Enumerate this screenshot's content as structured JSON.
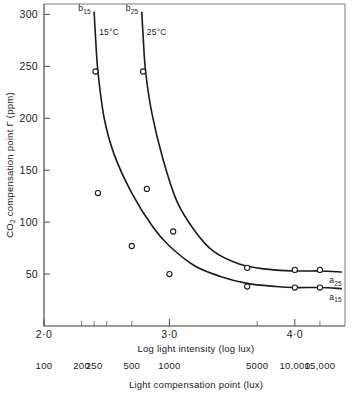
{
  "chart_data": {
    "type": "line",
    "title": "",
    "xlabel": "Log light intensity (log lux)",
    "ylabel": "CO₂ compensation point Γ (ppm)",
    "secondary_xlabel": "Light compensation point (lux)",
    "xlim": [
      2.0,
      4.4
    ],
    "ylim": [
      0,
      310
    ],
    "grid": false,
    "legend": "none",
    "x_ticks": [
      {
        "value": 2.0,
        "label": "2·0",
        "major": true
      },
      {
        "value": 2.3,
        "label": "",
        "major": false
      },
      {
        "value": 2.4,
        "label": "",
        "major": false
      },
      {
        "value": 2.5,
        "label": "",
        "major": false
      },
      {
        "value": 2.7,
        "label": "",
        "major": false
      },
      {
        "value": 3.0,
        "label": "3·0",
        "major": true
      },
      {
        "value": 3.7,
        "label": "",
        "major": false
      },
      {
        "value": 4.0,
        "label": "4·0",
        "major": true
      },
      {
        "value": 4.2,
        "label": "",
        "major": false
      }
    ],
    "y_ticks": [
      {
        "value": 50,
        "label": "50"
      },
      {
        "value": 100,
        "label": "100"
      },
      {
        "value": 150,
        "label": "150"
      },
      {
        "value": 200,
        "label": "200"
      },
      {
        "value": 250,
        "label": "250"
      },
      {
        "value": 300,
        "label": "300"
      }
    ],
    "secondary_x_ticks": [
      {
        "value": 2.0,
        "label": "100"
      },
      {
        "value": 2.3,
        "label": "200"
      },
      {
        "value": 2.4,
        "label": "250"
      },
      {
        "value": 2.7,
        "label": "500"
      },
      {
        "value": 3.0,
        "label": "1000"
      },
      {
        "value": 3.7,
        "label": "5000"
      },
      {
        "value": 4.0,
        "label": "10,000"
      },
      {
        "value": 4.2,
        "label": "15,000"
      }
    ],
    "series": [
      {
        "name": "15°C",
        "label": "15°C",
        "start_label": "b",
        "start_label_sub": "15",
        "end_label": "a",
        "end_label_sub": "15",
        "color": "#1a1a1a",
        "x": [
          2.4,
          2.41,
          2.43,
          2.48,
          2.56,
          2.7,
          2.87,
          3.0,
          3.2,
          3.4,
          3.62,
          3.85,
          4.0,
          4.2,
          4.37
        ],
        "y": [
          302,
          280,
          245,
          200,
          165,
          128,
          95,
          77,
          58,
          48,
          41,
          38,
          37,
          37,
          36
        ],
        "points": [
          {
            "x": 2.41,
            "y": 245
          },
          {
            "x": 2.43,
            "y": 128
          },
          {
            "x": 2.7,
            "y": 77
          },
          {
            "x": 3.0,
            "y": 50
          },
          {
            "x": 3.62,
            "y": 38
          },
          {
            "x": 4.0,
            "y": 37
          },
          {
            "x": 4.2,
            "y": 37
          }
        ]
      },
      {
        "name": "25°C",
        "label": "25°C",
        "start_label": "b",
        "start_label_sub": "25",
        "end_label": "a",
        "end_label_sub": "25",
        "color": "#1a1a1a",
        "x": [
          2.78,
          2.79,
          2.81,
          2.86,
          2.95,
          3.06,
          3.2,
          3.35,
          3.55,
          3.75,
          4.0,
          4.2,
          4.37
        ],
        "y": [
          302,
          280,
          245,
          205,
          160,
          120,
          92,
          72,
          60,
          55,
          53,
          53,
          52
        ],
        "points": [
          {
            "x": 2.79,
            "y": 245
          },
          {
            "x": 2.82,
            "y": 132
          },
          {
            "x": 3.03,
            "y": 91
          },
          {
            "x": 3.62,
            "y": 56
          },
          {
            "x": 4.0,
            "y": 54
          },
          {
            "x": 4.2,
            "y": 54
          }
        ]
      }
    ]
  },
  "axes": {
    "y_title": "CO₂ compensation point Γ (ppm)",
    "y_title_main": "CO",
    "y_title_sub": "2",
    "y_title_rest": " compensation point Γ (ppm)",
    "x_title": "Log light intensity (log lux)",
    "x_title_secondary": "Light compensation point (lux)"
  },
  "annotations": {
    "series1_temp": "15°C",
    "series2_temp": "25°C",
    "b15_base": "b",
    "b15_sub": "15",
    "b25_base": "b",
    "b25_sub": "25",
    "a15_base": "a",
    "a15_sub": "15",
    "a25_base": "a",
    "a25_sub": "25"
  },
  "colors": {
    "curve": "#1a1a1a",
    "axis": "#3a3a3a",
    "frame": "#7b7b7b",
    "background": "#ffffff"
  }
}
